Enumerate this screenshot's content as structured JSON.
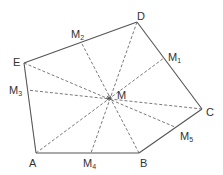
{
  "diagram": {
    "type": "geometry-pentagon",
    "colors": {
      "edge": "#555555",
      "dashed": "#6a6a6a",
      "text": "#333333",
      "background": "#ffffff"
    },
    "vertices": [
      {
        "id": "A",
        "label": "A",
        "x": 36,
        "y": 153,
        "lx": 29,
        "ly": 167
      },
      {
        "id": "B",
        "label": "B",
        "x": 139,
        "y": 153,
        "lx": 140,
        "ly": 167
      },
      {
        "id": "C",
        "label": "C",
        "x": 202,
        "y": 109,
        "lx": 206,
        "ly": 116
      },
      {
        "id": "D",
        "label": "D",
        "x": 137,
        "y": 22,
        "lx": 137,
        "ly": 20
      },
      {
        "id": "E",
        "label": "E",
        "x": 24,
        "y": 63,
        "lx": 13,
        "ly": 66
      }
    ],
    "center": {
      "id": "M",
      "label": "M",
      "x": 109,
      "y": 98,
      "lx": 117,
      "ly": 99
    },
    "midpoints": [
      {
        "id": "M1",
        "label": "M",
        "sub": "1",
        "side": "DC",
        "x": 164,
        "y": 58,
        "lx": 168,
        "ly": 61
      },
      {
        "id": "M2",
        "label": "M",
        "sub": "2",
        "side": "ED",
        "x": 81,
        "y": 42,
        "lx": 71,
        "ly": 38
      },
      {
        "id": "M3",
        "label": "M",
        "sub": "3",
        "side": "EA",
        "x": 27,
        "y": 90,
        "lx": 9,
        "ly": 94
      },
      {
        "id": "M4",
        "label": "M",
        "sub": "4",
        "side": "AB",
        "x": 91,
        "y": 153,
        "lx": 83,
        "ly": 167
      },
      {
        "id": "M5",
        "label": "M",
        "sub": "5",
        "side": "BC",
        "x": 175,
        "y": 127,
        "lx": 180,
        "ly": 140
      }
    ],
    "edges": [
      [
        "A",
        "B"
      ],
      [
        "B",
        "C"
      ],
      [
        "C",
        "D"
      ],
      [
        "D",
        "E"
      ],
      [
        "E",
        "A"
      ]
    ],
    "medians": [
      {
        "from": "D",
        "to": "M4"
      },
      {
        "from": "E",
        "to": "M5"
      },
      {
        "from": "A",
        "to": "M1"
      },
      {
        "from": "B",
        "to": "M2"
      },
      {
        "from": "C",
        "to": "M3"
      }
    ]
  }
}
